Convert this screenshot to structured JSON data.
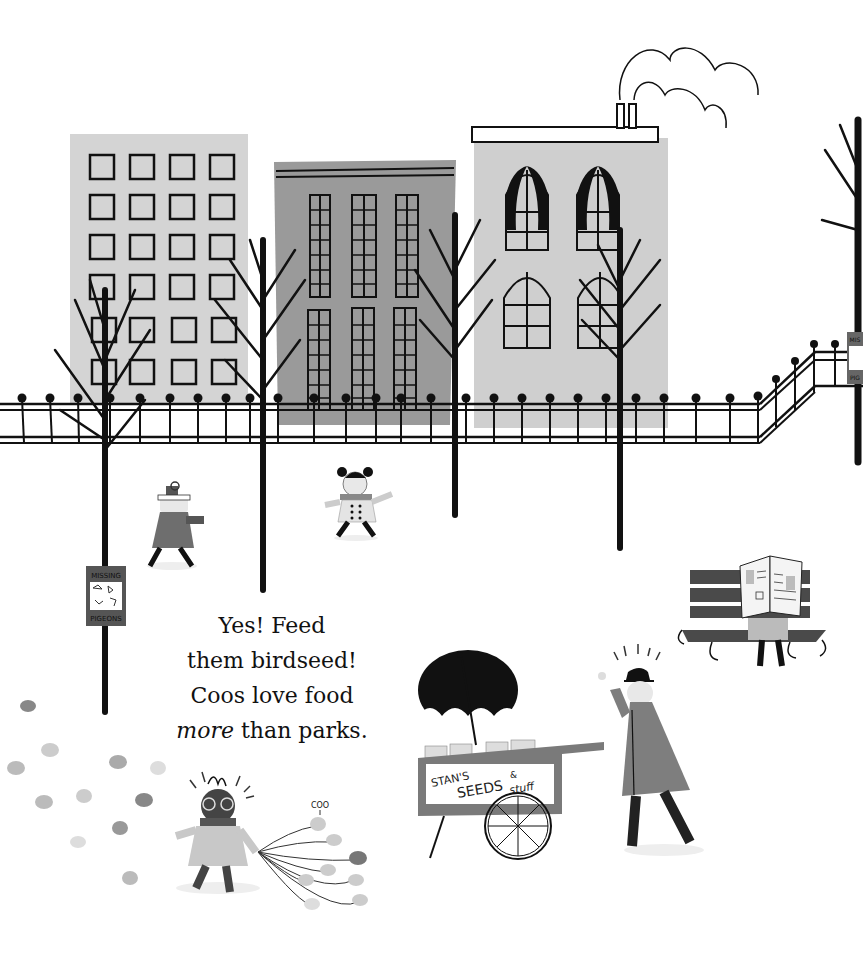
{
  "scene": {
    "type": "children's book illustration, grayscale",
    "colors": {
      "background": "#ffffff",
      "building_light": "#d4d4d4",
      "building_mid": "#9a9a9a",
      "building_right": "#cfcfcf",
      "ink": "#111111",
      "coat_gray": "#7e7e7e",
      "bench": "#4a4a4a"
    }
  },
  "narration": {
    "line1": "Yes! Feed",
    "line2": "them birdseed!",
    "line3": "Coos love food",
    "line4_emphasis": "more",
    "line4_rest": " than parks."
  },
  "sign_left": {
    "top": "MISSING",
    "bottom": "PIGEONS"
  },
  "sign_right": {
    "top": "MIS",
    "bottom": "PIG"
  },
  "cart": {
    "line1": "STAN'S",
    "line2": "SEEDS",
    "amp": "&",
    "line3": "stuff"
  },
  "pigeon_sound": "COO"
}
